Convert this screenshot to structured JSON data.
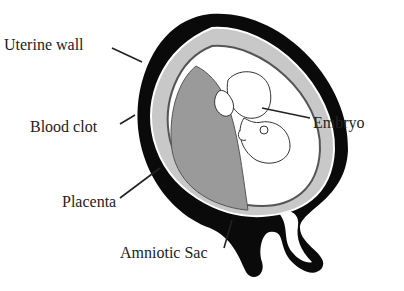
{
  "diagram": {
    "type": "anatomical-illustration",
    "labels": {
      "uterine_wall": "Uterine wall",
      "blood_clot": "Blood clot",
      "placenta": "Placenta",
      "amniotic_sac": "Amniotic Sac",
      "embryo": "Embryo"
    },
    "colors": {
      "uterine_wall": "#0a0a0a",
      "blood_clot": "#c8c8c8",
      "placenta": "#9a9a9a",
      "amniotic_cavity": "#ffffff",
      "leader_lines": "#222222"
    }
  }
}
